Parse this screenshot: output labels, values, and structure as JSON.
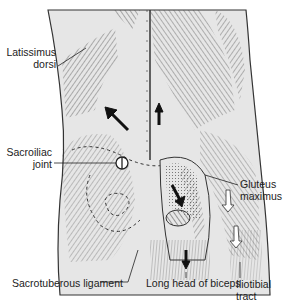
{
  "figure": {
    "type": "anatomical-diagram",
    "colors": {
      "background": "#ffffff",
      "tissue_fill": "#e6e6e6",
      "line": "#333333",
      "arrow": "#111111"
    }
  },
  "labels": {
    "latissimus_1": "Latissimus",
    "latissimus_2": "dorsi",
    "sacroiliac_1": "Sacroiliac",
    "sacroiliac_2": "joint",
    "gluteus_1": "Gluteus",
    "gluteus_2": "maximus",
    "sacrotuberous": "Sacrotuberous ligament",
    "biceps": "Long head of biceps",
    "iliotibial_1": "Iliotibial",
    "iliotibial_2": "tract"
  }
}
